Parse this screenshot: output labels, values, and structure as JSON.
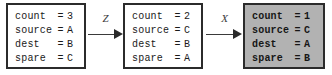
{
  "diagram": {
    "background_color": "#ffffff",
    "border_color": "#2b2b2b",
    "shaded_fill_color": "#b2b2b2",
    "boxes": [
      {
        "id": "state-1",
        "shaded": false,
        "rows": [
          {
            "name": "count",
            "eq": "=",
            "value": "3"
          },
          {
            "name": "source",
            "eq": "=",
            "value": "A"
          },
          {
            "name": "dest",
            "eq": "=",
            "value": "B"
          },
          {
            "name": "spare",
            "eq": "=",
            "value": "C"
          }
        ]
      },
      {
        "id": "state-2",
        "shaded": false,
        "rows": [
          {
            "name": "count",
            "eq": "=",
            "value": "2"
          },
          {
            "name": "source",
            "eq": "=",
            "value": "C"
          },
          {
            "name": "dest",
            "eq": "=",
            "value": "B"
          },
          {
            "name": "spare",
            "eq": "=",
            "value": "A"
          }
        ]
      },
      {
        "id": "state-3",
        "shaded": true,
        "rows": [
          {
            "name": "count",
            "eq": "=",
            "value": "1"
          },
          {
            "name": "source",
            "eq": "=",
            "value": "C"
          },
          {
            "name": "dest",
            "eq": "=",
            "value": "A"
          },
          {
            "name": "spare",
            "eq": "=",
            "value": "B"
          }
        ]
      }
    ],
    "arrows": [
      {
        "id": "arrow-1",
        "label": "Z"
      },
      {
        "id": "arrow-2",
        "label": "X"
      }
    ]
  }
}
